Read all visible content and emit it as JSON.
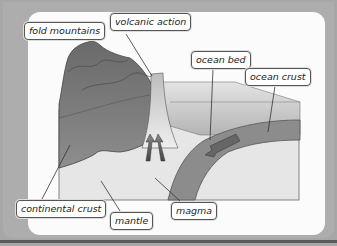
{
  "diagram": {
    "labels": {
      "fold_mountains": "fold mountains",
      "volcanic_action": "volcanic action",
      "ocean_bed": "ocean bed",
      "ocean_crust": "ocean crust",
      "continental_crust": "continental crust",
      "mantle": "mantle",
      "magma": "magma"
    },
    "colors": {
      "frame": "#a7a7a7",
      "panel": "#fbfbfb",
      "continental_crust_dark": "#5e5e5e",
      "continental_crust_light": "#9a9a9a",
      "ocean_crust": "#8c8c8c",
      "ocean_water": "#c8c8c8",
      "mantle": "#e6e6e6"
    }
  }
}
